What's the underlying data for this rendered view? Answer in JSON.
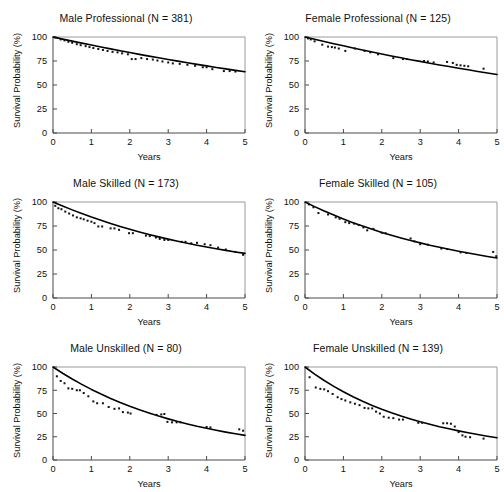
{
  "figure": {
    "background": "#ffffff",
    "line_color": "#000000",
    "point_color": "#111111",
    "axis_color": "#4a4a4a",
    "rows": 3,
    "cols": 2
  },
  "axes": {
    "xlabel": "Years",
    "ylabel": "Survival Probability (%)",
    "xticks": [
      "0",
      "1",
      "2",
      "3",
      "4",
      "5"
    ],
    "yticks": [
      "0",
      "25",
      "50",
      "75",
      "100"
    ],
    "xlim": [
      0,
      5
    ],
    "ylim": [
      0,
      100
    ]
  },
  "chart_data": [
    {
      "type": "line",
      "title": "Male Professional (N = 381)",
      "xlabel": "Years",
      "ylabel": "Survival Probability (%)",
      "xlim": [
        0,
        5
      ],
      "ylim": [
        0,
        100
      ],
      "grid": false,
      "legend": "none",
      "n": 381,
      "sex": "Male",
      "occupation": "Professional",
      "series": [
        {
          "name": "Fitted survival curve",
          "kind": "line",
          "x": [
            0,
            0.25,
            0.5,
            0.75,
            1,
            1.25,
            1.5,
            1.75,
            2,
            2.25,
            2.5,
            2.75,
            3,
            3.25,
            3.5,
            3.75,
            4,
            4.25,
            4.5,
            4.75,
            5
          ],
          "y": [
            100,
            97.8,
            95.7,
            93.6,
            91.6,
            89.6,
            87.6,
            85.7,
            83.8,
            81.9,
            80.1,
            78.3,
            76.6,
            74.9,
            73.2,
            71.5,
            69.9,
            68.3,
            66.8,
            65.2,
            63.8
          ]
        },
        {
          "name": "Observed survival estimates",
          "kind": "scatter",
          "x": [
            0.05,
            0.12,
            0.2,
            0.3,
            0.4,
            0.5,
            0.62,
            0.72,
            0.85,
            0.95,
            1.05,
            1.18,
            1.3,
            1.42,
            1.55,
            1.68,
            1.8,
            1.95,
            2.05,
            2.15,
            2.3,
            2.45,
            2.6,
            2.72,
            2.85,
            3.0,
            3.12,
            3.3,
            3.5,
            3.7,
            3.9,
            4.0,
            4.15,
            4.45,
            4.6,
            4.75
          ],
          "y": [
            99.5,
            99,
            97.5,
            96.5,
            95,
            94,
            92.5,
            91.5,
            90.5,
            89.5,
            88.5,
            87.5,
            86.5,
            85.5,
            84.5,
            84,
            83,
            82,
            77,
            77,
            78,
            77,
            76.5,
            75.5,
            74.5,
            73.5,
            72.5,
            72,
            71,
            70,
            68.5,
            68.5,
            66.5,
            64.5,
            64.5,
            64
          ]
        }
      ]
    },
    {
      "type": "line",
      "title": "Female Professional (N = 125)",
      "xlabel": "Years",
      "ylabel": "Survival Probability (%)",
      "xlim": [
        0,
        5
      ],
      "ylim": [
        0,
        100
      ],
      "grid": false,
      "legend": "none",
      "n": 125,
      "sex": "Female",
      "occupation": "Professional",
      "series": [
        {
          "name": "Fitted survival curve",
          "kind": "line",
          "x": [
            0,
            0.25,
            0.5,
            0.75,
            1,
            1.25,
            1.5,
            1.75,
            2,
            2.25,
            2.5,
            2.75,
            3,
            3.25,
            3.5,
            3.75,
            4,
            4.25,
            4.5,
            4.75,
            5
          ],
          "y": [
            100,
            97.6,
            95.3,
            93.0,
            90.8,
            88.6,
            86.5,
            84.4,
            82.3,
            80.3,
            78.4,
            76.4,
            74.6,
            72.7,
            70.9,
            69.2,
            67.4,
            65.8,
            64.1,
            62.5,
            60.9
          ]
        },
        {
          "name": "Observed survival estimates",
          "kind": "scatter",
          "x": [
            0.08,
            0.15,
            0.25,
            0.45,
            0.6,
            0.7,
            0.78,
            0.88,
            1.05,
            1.3,
            1.55,
            1.7,
            1.9,
            2.3,
            2.55,
            2.65,
            3.1,
            3.2,
            3.35,
            3.7,
            3.85,
            3.95,
            4.05,
            4.15,
            4.25,
            4.65
          ],
          "y": [
            98.5,
            97.5,
            95.5,
            92,
            90,
            89.5,
            89,
            88,
            85.5,
            88,
            85.5,
            84,
            82,
            78,
            77,
            77,
            75,
            74.5,
            73.5,
            74,
            73,
            71,
            70.5,
            70,
            69.5,
            67
          ]
        }
      ]
    },
    {
      "type": "line",
      "title": "Male Skilled (N = 173)",
      "xlabel": "Years",
      "ylabel": "Survival Probability (%)",
      "xlim": [
        0,
        5
      ],
      "ylim": [
        0,
        100
      ],
      "grid": false,
      "legend": "none",
      "n": 173,
      "sex": "Male",
      "occupation": "Skilled",
      "series": [
        {
          "name": "Fitted survival curve",
          "kind": "line",
          "x": [
            0,
            0.25,
            0.5,
            0.75,
            1,
            1.25,
            1.5,
            1.75,
            2,
            2.25,
            2.5,
            2.75,
            3,
            3.25,
            3.5,
            3.75,
            4,
            4.25,
            4.5,
            4.75,
            5
          ],
          "y": [
            100,
            95.8,
            91.8,
            88.0,
            84.3,
            80.9,
            77.6,
            74.5,
            71.6,
            68.8,
            66.2,
            63.7,
            61.3,
            59.1,
            57.0,
            55.0,
            53.1,
            51.3,
            49.6,
            48.0,
            46.5
          ]
        },
        {
          "name": "Observed survival estimates",
          "kind": "scatter",
          "x": [
            0.06,
            0.14,
            0.22,
            0.32,
            0.42,
            0.52,
            0.62,
            0.72,
            0.8,
            0.9,
            1.0,
            1.08,
            1.18,
            1.28,
            1.5,
            1.6,
            1.72,
            1.98,
            2.08,
            2.42,
            2.52,
            2.68,
            2.78,
            2.9,
            3.0,
            3.35,
            3.45,
            3.6,
            3.75,
            3.95,
            4.1,
            4.3,
            4.5,
            4.75,
            4.95
          ],
          "y": [
            96,
            93.5,
            92.5,
            90,
            88,
            86,
            84,
            83,
            82,
            80.5,
            79.5,
            78,
            74.5,
            74.5,
            72.5,
            72.5,
            71,
            67.5,
            67.5,
            65,
            64.5,
            63,
            61.5,
            60.5,
            60.5,
            58.5,
            58.5,
            57,
            57.5,
            56,
            55,
            52.5,
            50.5,
            48,
            45
          ]
        }
      ]
    },
    {
      "type": "line",
      "title": "Female Skilled (N = 105)",
      "xlabel": "Years",
      "ylabel": "Survival Probability (%)",
      "xlim": [
        0,
        5
      ],
      "ylim": [
        0,
        100
      ],
      "grid": false,
      "legend": "none",
      "n": 105,
      "sex": "Female",
      "occupation": "Skilled",
      "series": [
        {
          "name": "Fitted survival curve",
          "kind": "line",
          "x": [
            0,
            0.25,
            0.5,
            0.75,
            1,
            1.25,
            1.5,
            1.75,
            2,
            2.25,
            2.5,
            2.75,
            3,
            3.25,
            3.5,
            3.75,
            4,
            4.25,
            4.5,
            4.75,
            5
          ],
          "y": [
            100,
            95.2,
            90.7,
            86.4,
            82.3,
            78.5,
            74.9,
            71.5,
            68.3,
            65.3,
            62.5,
            59.9,
            57.4,
            55.0,
            52.8,
            50.7,
            48.7,
            46.8,
            45.0,
            43.3,
            41.7
          ]
        },
        {
          "name": "Observed survival estimates",
          "kind": "scatter",
          "x": [
            0.1,
            0.22,
            0.35,
            0.6,
            0.8,
            0.9,
            1.05,
            1.15,
            1.28,
            1.4,
            1.52,
            1.62,
            1.78,
            2.0,
            2.1,
            2.75,
            2.85,
            3.0,
            3.2,
            3.55,
            3.7,
            4.05,
            4.2,
            4.9,
            4.98
          ],
          "y": [
            97.5,
            94.5,
            88.5,
            87,
            84,
            82.5,
            79,
            78,
            77.5,
            76,
            73.5,
            70.5,
            72,
            68,
            67.5,
            62,
            59,
            56,
            55.5,
            51.5,
            51,
            47.5,
            47,
            48,
            43.5
          ]
        }
      ]
    },
    {
      "type": "line",
      "title": "Male Unskilled (N = 80)",
      "xlabel": "Years",
      "ylabel": "Survival Probability (%)",
      "xlim": [
        0,
        5
      ],
      "ylim": [
        0,
        100
      ],
      "grid": false,
      "legend": "none",
      "n": 80,
      "sex": "Male",
      "occupation": "Unskilled",
      "series": [
        {
          "name": "Fitted survival curve",
          "kind": "line",
          "x": [
            0,
            0.25,
            0.5,
            0.75,
            1,
            1.25,
            1.5,
            1.75,
            2,
            2.25,
            2.5,
            2.75,
            3,
            3.25,
            3.5,
            3.75,
            4,
            4.25,
            4.5,
            4.75,
            5
          ],
          "y": [
            100,
            93.3,
            87.1,
            81.3,
            75.9,
            70.9,
            66.2,
            61.8,
            57.7,
            54.0,
            50.5,
            47.2,
            44.2,
            41.4,
            38.8,
            36.3,
            34.1,
            32.0,
            30.0,
            28.2,
            26.5
          ]
        },
        {
          "name": "Observed survival estimates",
          "kind": "scatter",
          "x": [
            0.1,
            0.2,
            0.3,
            0.4,
            0.5,
            0.62,
            0.7,
            0.8,
            0.92,
            1.05,
            1.15,
            1.3,
            1.45,
            1.6,
            1.72,
            1.82,
            1.95,
            2.02,
            2.7,
            2.82,
            2.9,
            2.98,
            3.1,
            3.22,
            3.32,
            4.0,
            4.1,
            4.85,
            4.95
          ],
          "y": [
            90,
            85,
            82.5,
            77,
            76.5,
            75,
            75,
            72,
            68.5,
            63,
            61,
            61,
            57,
            55,
            55.5,
            51.5,
            51,
            50,
            48.5,
            49,
            49.5,
            41,
            40.5,
            40.5,
            40.5,
            35.5,
            35,
            33,
            31.5
          ]
        }
      ]
    },
    {
      "type": "line",
      "title": "Female Unskilled (N = 139)",
      "xlabel": "Years",
      "ylabel": "Survival Probability (%)",
      "xlim": [
        0,
        5
      ],
      "ylim": [
        0,
        100
      ],
      "grid": false,
      "legend": "none",
      "n": 139,
      "sex": "Female",
      "occupation": "Unskilled",
      "series": [
        {
          "name": "Fitted survival curve",
          "kind": "line",
          "x": [
            0,
            0.25,
            0.5,
            0.75,
            1,
            1.25,
            1.5,
            1.75,
            2,
            2.25,
            2.5,
            2.75,
            3,
            3.25,
            3.5,
            3.75,
            4,
            4.25,
            4.5,
            4.75,
            5
          ],
          "y": [
            100,
            92.4,
            85.5,
            79.2,
            73.4,
            68.1,
            63.2,
            58.7,
            54.6,
            50.8,
            47.3,
            44.1,
            41.1,
            38.4,
            35.8,
            33.5,
            31.3,
            29.3,
            27.4,
            25.6,
            24.0
          ]
        },
        {
          "name": "Observed survival estimates",
          "kind": "scatter",
          "x": [
            0.12,
            0.28,
            0.4,
            0.5,
            0.6,
            0.72,
            0.85,
            0.95,
            1.05,
            1.18,
            1.3,
            1.42,
            1.55,
            1.65,
            1.75,
            1.85,
            1.95,
            2.05,
            2.18,
            2.3,
            2.45,
            2.55,
            2.95,
            3.05,
            3.6,
            3.7,
            3.8,
            3.9,
            4.0,
            4.1,
            4.18,
            4.3,
            4.65
          ],
          "y": [
            89,
            78,
            76.5,
            76,
            74,
            71,
            67.5,
            65.5,
            64,
            62,
            60.5,
            59,
            56,
            55.5,
            55.5,
            52,
            50,
            46.5,
            45.5,
            45,
            43.5,
            43.5,
            40,
            40,
            39.5,
            39.5,
            39,
            36,
            30,
            26.5,
            25,
            24.5,
            23
          ]
        }
      ]
    }
  ]
}
